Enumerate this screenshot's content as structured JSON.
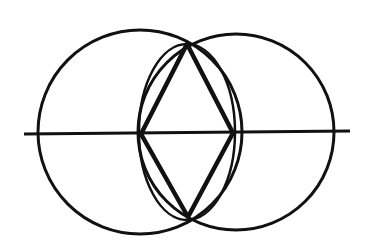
{
  "diagram": {
    "type": "geometric-construction",
    "stroke_color": "#111111",
    "background": "#ffffff",
    "shapes": {
      "left_circle": {
        "cx": 140,
        "cy": 132,
        "r": 102
      },
      "right_circle": {
        "cx": 236,
        "cy": 132,
        "r": 98
      },
      "inner_lens": {
        "cx": 187,
        "cy": 132,
        "rx": 48,
        "ry": 88
      },
      "horizontal_line": {
        "x1": 24,
        "y1": 134,
        "x2": 350,
        "y2": 131
      },
      "rhombus": {
        "top": [
          187,
          44
        ],
        "right": [
          233,
          133
        ],
        "bottom": [
          188,
          217
        ],
        "left": [
          141,
          134
        ]
      }
    }
  }
}
